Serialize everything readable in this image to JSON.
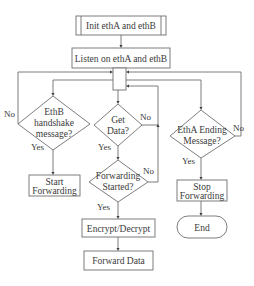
{
  "nodes": {
    "init": {
      "label": "Init ethA and ethB",
      "type": "predefined-process"
    },
    "listen": {
      "label": "Listen on ethA and ethB",
      "type": "process"
    },
    "ethb_decision": {
      "lines": [
        "EthB",
        "handshake",
        "message?"
      ],
      "type": "decision"
    },
    "getdata_decision": {
      "lines": [
        "Get",
        "Data?"
      ],
      "type": "decision"
    },
    "forwarding_decision": {
      "lines": [
        "Forwarding",
        "Started?"
      ],
      "type": "decision"
    },
    "etha_decision": {
      "lines": [
        "EthA Ending",
        "Message?"
      ],
      "type": "decision"
    },
    "start_forwarding": {
      "lines": [
        "Start",
        "Forwarding"
      ],
      "type": "process"
    },
    "encrypt": {
      "label": "Encrypt/Decrypt",
      "type": "process"
    },
    "forward_data": {
      "label": "Forward Data",
      "type": "process"
    },
    "stop_forwarding": {
      "lines": [
        "Stop",
        "Forwarding"
      ],
      "type": "process"
    },
    "end": {
      "label": "End",
      "type": "terminal"
    }
  },
  "edge_labels": {
    "ethb_no": "No",
    "ethb_yes": "Yes",
    "getdata_no": "No",
    "getdata_yes": "Yes",
    "forwarding_no": "No",
    "forwarding_yes": "Yes",
    "etha_no": "No",
    "etha_yes": "Yes"
  },
  "colors": {
    "stroke": "#6e6e6e",
    "text": "#3a3a3a",
    "background": "#ffffff"
  }
}
